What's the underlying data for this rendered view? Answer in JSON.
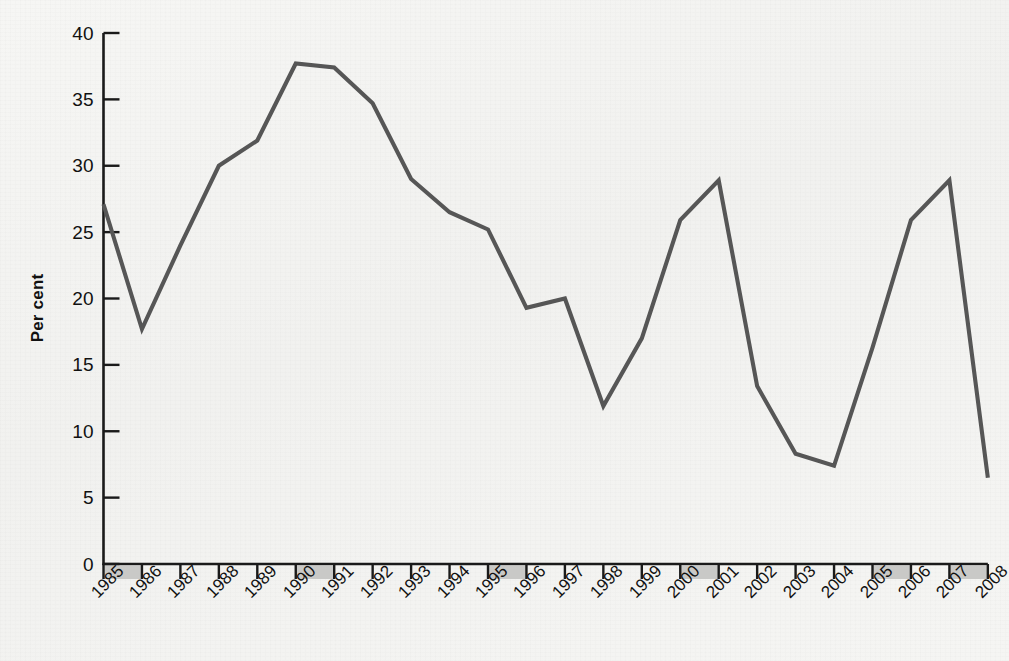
{
  "figure": {
    "background_color": "#f4f4f2",
    "line_color": "#565656",
    "axis_color": "#1a1a1a",
    "band_fill_color": "#c9c9c7",
    "ylabel": "Per cent"
  },
  "chart_data": {
    "type": "line",
    "title": "",
    "subtitle": "",
    "xlabel": "",
    "ylabel": "Per cent",
    "grid": false,
    "legend_position": "none",
    "xlim": [
      1985,
      2008
    ],
    "ylim": [
      0,
      40
    ],
    "ytick_labels": [
      "0",
      "5",
      "10",
      "15",
      "20",
      "25",
      "30",
      "35",
      "40"
    ],
    "yticks": [
      0,
      5,
      10,
      15,
      20,
      25,
      30,
      35,
      40
    ],
    "xtick_labels": [
      "1985",
      "1986",
      "1987",
      "1988",
      "1989",
      "1990",
      "1991",
      "1992",
      "1993",
      "1994",
      "1995",
      "1996",
      "1997",
      "1998",
      "1999",
      "2000",
      "2001",
      "2002",
      "2003",
      "2004",
      "2005",
      "2006",
      "2007",
      "2008"
    ],
    "x": [
      1985,
      1986,
      1987,
      1988,
      1989,
      1990,
      1991,
      1992,
      1993,
      1994,
      1995,
      1996,
      1997,
      1998,
      1999,
      2000,
      2001,
      2002,
      2003,
      2004,
      2005,
      2006,
      2007,
      2008
    ],
    "values": [
      27.1,
      17.7,
      24.0,
      30.0,
      31.9,
      37.7,
      37.4,
      34.7,
      29.0,
      26.5,
      25.2,
      19.3,
      20.0,
      11.9,
      17.0,
      25.9,
      28.9,
      13.4,
      8.3,
      7.4,
      16.3,
      25.9,
      28.9,
      6.5
    ],
    "shaded_x_axis_bands": [
      "1985",
      "1990",
      "1995",
      "2000",
      "2005",
      "2008"
    ],
    "annotations": []
  }
}
